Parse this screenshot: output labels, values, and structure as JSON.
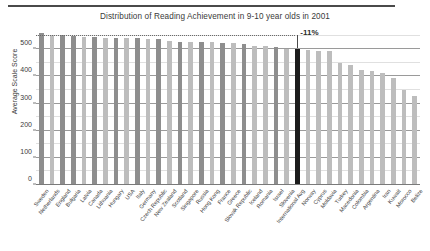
{
  "chart_data": {
    "type": "bar",
    "title": "Distribution of Reading Achievement in 9-10 year olds in 2001",
    "xlabel": "",
    "ylabel": "Average Scale Score",
    "ylim": [
      0,
      560
    ],
    "yticks": [
      0,
      100,
      200,
      300,
      400,
      500
    ],
    "ytick_labels": [
      "0",
      "100",
      "200",
      "300",
      "400",
      "500"
    ],
    "grid": true,
    "grid_minor_step": 50,
    "legend": "none",
    "highlight_category": "International Avg",
    "annotations": [
      {
        "text": "-11%",
        "target": "International Avg"
      }
    ],
    "categories": [
      "Sweden",
      "Netherlands",
      "England",
      "Bulgaria",
      "Latvia",
      "Canada",
      "Lithuania",
      "Hungary",
      "USA",
      "Italy",
      "Germany",
      "Czech Republic",
      "New Zealand",
      "Scotland",
      "Singapore",
      "Russia",
      "Hong Kong",
      "France",
      "Greece",
      "Slovak Republic",
      "Iceland",
      "Romania",
      "Israel",
      "Slovenia",
      "International Avg",
      "Norway",
      "Cyprus",
      "Moldavia",
      "Turkey",
      "Macedonia",
      "Colombia",
      "Argentina",
      "Iran",
      "Kuwait",
      "Morocco",
      "Belize"
    ],
    "values": [
      561,
      554,
      553,
      550,
      545,
      544,
      543,
      543,
      542,
      541,
      539,
      537,
      529,
      528,
      528,
      528,
      528,
      525,
      524,
      518,
      512,
      512,
      509,
      502,
      500,
      499,
      494,
      492,
      449,
      442,
      422,
      420,
      414,
      396,
      350,
      327
    ],
    "bar_shades": [
      "dark",
      "light",
      "dark",
      "dark",
      "light",
      "dark",
      "light",
      "dark",
      "light",
      "dark",
      "light",
      "dark",
      "light",
      "dark",
      "light",
      "dark",
      "light",
      "dark",
      "light",
      "dark",
      "light",
      "light",
      "dark",
      "light",
      "black",
      "light",
      "light",
      "light",
      "light",
      "light",
      "light",
      "light",
      "light",
      "light",
      "light",
      "light"
    ]
  },
  "colors": {
    "bar_dark": "#8e8e8e",
    "bar_light": "#bdbdbd",
    "bar_black": "#1c1c1c",
    "grid_major": "#9a9a9a",
    "grid_minor": "#e0e0e0",
    "rule": "#4a4a4a",
    "text": "#3a3a3a"
  }
}
